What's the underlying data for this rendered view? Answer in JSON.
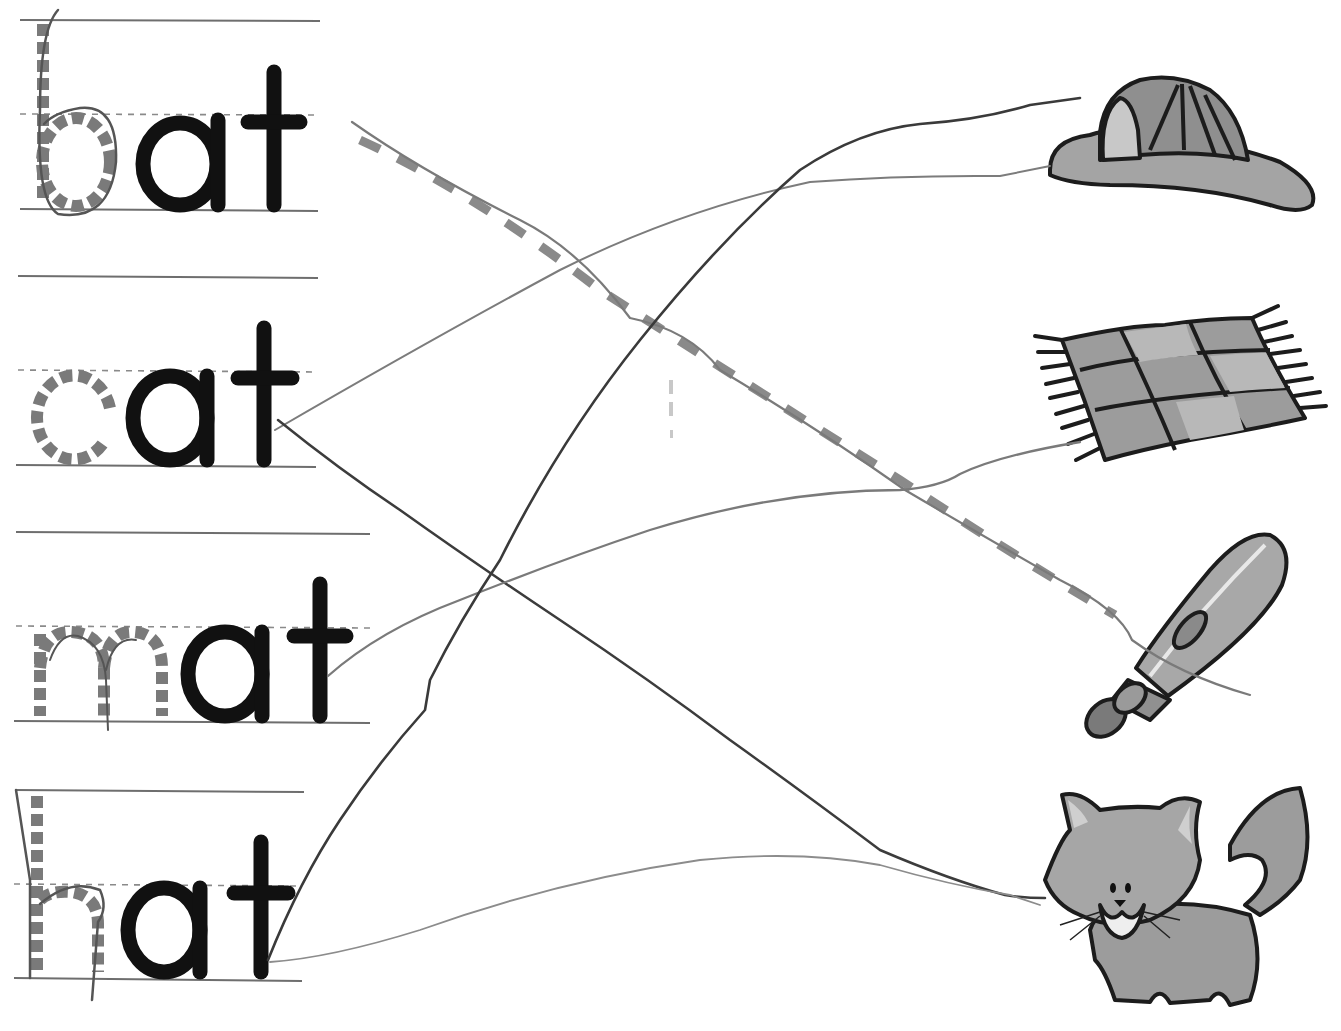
{
  "worksheet": {
    "activity": "Trace the first letter and draw a line to match each word to its picture",
    "colors": {
      "ink": "#111111",
      "trace_gray": "#7a7a7a",
      "guide_line": "#6e6e6e",
      "pencil_dark": "#3a3a3a",
      "pencil_light": "#8c8c8c",
      "picture_fill": "#9a9a9a"
    },
    "words": [
      {
        "text": "bat",
        "traced_letter": "b",
        "printed_letters": "at"
      },
      {
        "text": "cat",
        "traced_letter": "c",
        "printed_letters": "at"
      },
      {
        "text": "mat",
        "traced_letter": "m",
        "printed_letters": "at"
      },
      {
        "text": "hat",
        "traced_letter": "h",
        "printed_letters": "at"
      }
    ],
    "pictures": [
      {
        "name": "firefighter hat",
        "icon": "hat-icon"
      },
      {
        "name": "rug / mat",
        "icon": "mat-icon"
      },
      {
        "name": "baseball bat",
        "icon": "bat-icon"
      },
      {
        "name": "cat",
        "icon": "cat-icon"
      }
    ],
    "matches_drawn": [
      {
        "from": "bat",
        "to": "bat",
        "style": "dashed guide line traced in pencil"
      },
      {
        "from": "cat",
        "to": "hat",
        "style": "pencil line"
      },
      {
        "from": "cat",
        "to": "cat",
        "style": "pencil line"
      },
      {
        "from": "mat",
        "to": "mat",
        "style": "pencil line"
      },
      {
        "from": "hat",
        "to": "hat",
        "style": "pencil line"
      },
      {
        "from": "hat",
        "to": "cat",
        "style": "pencil line"
      }
    ]
  }
}
